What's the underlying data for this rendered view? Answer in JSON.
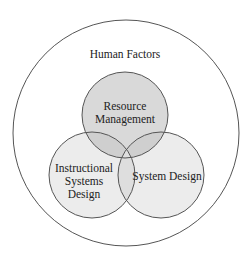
{
  "diagram": {
    "type": "venn",
    "outer": {
      "label": "Human Factors"
    },
    "circles": [
      {
        "id": "resource",
        "lines": [
          "Resource",
          "Management"
        ]
      },
      {
        "id": "instructional",
        "lines": [
          "Instructional",
          "Systems",
          "Design"
        ]
      },
      {
        "id": "system",
        "lines": [
          "System Design"
        ]
      }
    ],
    "colors": {
      "stroke": "#555555",
      "fill": "#dcdcdc",
      "background": "#ffffff"
    }
  }
}
